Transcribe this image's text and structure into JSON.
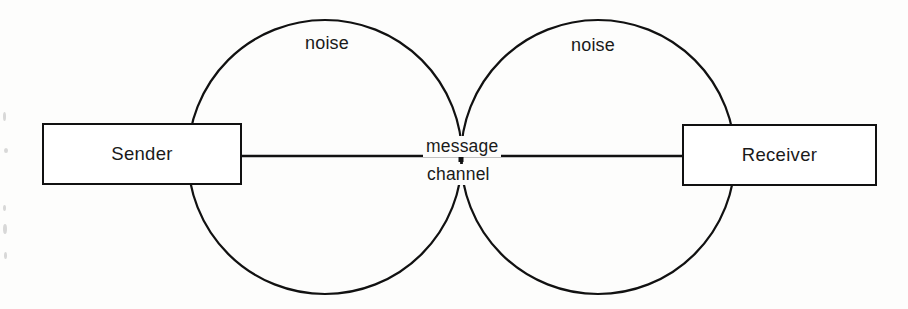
{
  "diagram": {
    "type": "block-diagram",
    "background_color": "#fdfdfc",
    "stroke_color": "#111111",
    "text_color": "#1a1a1a",
    "nodes": [
      {
        "id": "sender",
        "label": "Sender",
        "shape": "rectangle",
        "x": 42,
        "y": 123,
        "width": 200,
        "height": 62
      },
      {
        "id": "receiver",
        "label": "Receiver",
        "shape": "rectangle",
        "x": 682,
        "y": 124,
        "width": 195,
        "height": 62
      }
    ],
    "circles": [
      {
        "id": "noise-circle-left",
        "label": "noise",
        "cx": 325,
        "cy": 157,
        "r": 137
      },
      {
        "id": "noise-circle-right",
        "label": "noise",
        "cx": 598,
        "cy": 157,
        "r": 137
      }
    ],
    "connector": {
      "id": "message-channel",
      "from": "sender",
      "to": "receiver",
      "label_above": "message",
      "label_below": "channel",
      "y": 156,
      "x_start": 242,
      "x_end": 682
    },
    "labels": {
      "noise_left": "noise",
      "noise_right": "noise",
      "message": "message",
      "channel": "channel",
      "sender": "Sender",
      "receiver": "Receiver"
    }
  }
}
